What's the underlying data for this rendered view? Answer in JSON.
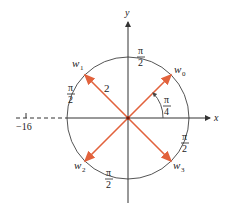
{
  "diagram": {
    "axes": {
      "x_label": "x",
      "y_label": "y",
      "tick_label": "−16"
    },
    "radius_label": "2",
    "angle_label": {
      "numerator": "π",
      "denominator": "4"
    },
    "arc_labels": [
      {
        "id": "top",
        "numerator": "π",
        "denominator": "2"
      },
      {
        "id": "left",
        "numerator": "π",
        "denominator": "2"
      },
      {
        "id": "bottom",
        "numerator": "π",
        "denominator": "2"
      },
      {
        "id": "right",
        "numerator": "π",
        "denominator": "2"
      }
    ],
    "roots": [
      {
        "label": "w",
        "sub": "0",
        "angle_deg": 45
      },
      {
        "label": "w",
        "sub": "1",
        "angle_deg": 135
      },
      {
        "label": "w",
        "sub": "2",
        "angle_deg": 225
      },
      {
        "label": "w",
        "sub": "3",
        "angle_deg": 315
      }
    ],
    "colors": {
      "vector": "#e2623c",
      "circle": "#555555",
      "axis": "#333333",
      "text": "#222222"
    }
  }
}
